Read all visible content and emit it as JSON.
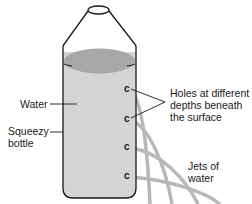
{
  "figure": {
    "labels": {
      "water": "Water",
      "bottle_line1": "Squeezy",
      "bottle_line2": "bottle",
      "holes_line1": "Holes at different",
      "holes_line2": "depths beneath",
      "holes_line3": "the surface",
      "jets_line1": "Jets of",
      "jets_line2": "water"
    },
    "holes": [
      {
        "id": 1,
        "glyph": "c",
        "y": 88
      },
      {
        "id": 2,
        "glyph": "c",
        "y": 118
      },
      {
        "id": 3,
        "glyph": "c",
        "y": 146
      },
      {
        "id": 4,
        "glyph": "c",
        "y": 175
      }
    ],
    "colors": {
      "outline": "#1a1a1a",
      "water_body": "#d4d4d4",
      "water_surface": "#a8a8a8",
      "jet": "#b8b8b8",
      "text": "#1a1a1a"
    }
  }
}
